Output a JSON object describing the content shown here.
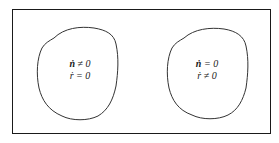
{
  "diagram": {
    "frame": {
      "stroke_color": "#1a1a1a"
    },
    "regions": [
      {
        "id": "left-region",
        "lines": [
          {
            "var": "ṅ",
            "rel": "≠",
            "val": "0"
          },
          {
            "var": "ṙ",
            "rel": "=",
            "val": "0"
          }
        ]
      },
      {
        "id": "right-region",
        "lines": [
          {
            "var": "ṅ",
            "rel": "=",
            "val": "0"
          },
          {
            "var": "ṙ",
            "rel": "≠",
            "val": "0"
          }
        ]
      }
    ],
    "outline_color": "#333333"
  }
}
